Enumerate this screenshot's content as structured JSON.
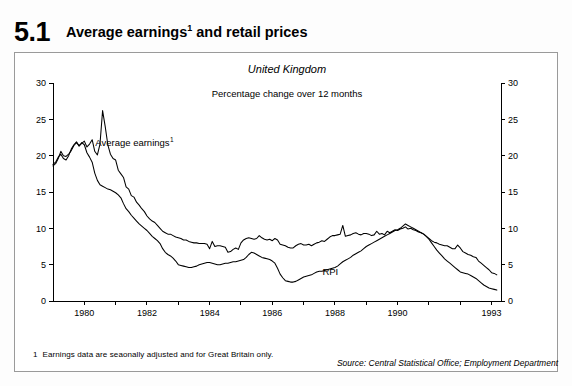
{
  "figure": {
    "number": "5.1",
    "title": "Average earnings",
    "title_sup": "1",
    "title_rest": " and retail prices"
  },
  "footnote": {
    "marker": "1",
    "text": "Earnings data are seaonally adjusted and for Great Britain only."
  },
  "source": {
    "text": "Source: Central Statistical Office; Employment Department"
  },
  "chart_data": {
    "type": "line",
    "title": "United Kingdom",
    "subtitle": "Percentage change over 12 months",
    "xlabel": "",
    "ylabel": "",
    "xlim": [
      1979.0,
      1993.3
    ],
    "ylim": [
      0,
      30
    ],
    "yticks": [
      0,
      5,
      10,
      15,
      20,
      25,
      30
    ],
    "ytick_labels": [
      "0",
      "5",
      "10",
      "15",
      "20",
      "25",
      "30"
    ],
    "xticks": [
      1980,
      1981,
      1982,
      1983,
      1984,
      1985,
      1986,
      1987,
      1988,
      1989,
      1990,
      1991,
      1992,
      1993
    ],
    "xtick_labels_shown": [
      "1980",
      "1982",
      "1984",
      "1986",
      "1988",
      "1990",
      "1993"
    ],
    "xtick_labels_values": [
      1980,
      1982,
      1984,
      1986,
      1988,
      1990,
      1993
    ],
    "grid": false,
    "legend_position": "inline-annotation",
    "annotations": [
      {
        "name": "average-earnings",
        "label": "Average earnings",
        "sup": "1",
        "x": 1980.35,
        "y": 21.3
      },
      {
        "name": "rpi",
        "label": "RPI",
        "x": 1987.6,
        "y": 3.6
      }
    ],
    "axes": {
      "left": true,
      "right": true,
      "bottom": true,
      "top": false
    },
    "series": [
      {
        "name": "Average earnings",
        "x": [
          1979.0,
          1979.083,
          1979.167,
          1979.25,
          1979.333,
          1979.417,
          1979.5,
          1979.583,
          1979.667,
          1979.75,
          1979.833,
          1979.917,
          1980.0,
          1980.083,
          1980.167,
          1980.25,
          1980.333,
          1980.417,
          1980.5,
          1980.583,
          1980.667,
          1980.75,
          1980.833,
          1980.917,
          1981.0,
          1981.083,
          1981.167,
          1981.25,
          1981.333,
          1981.417,
          1981.5,
          1981.583,
          1981.667,
          1981.75,
          1981.833,
          1981.917,
          1982.0,
          1982.083,
          1982.167,
          1982.25,
          1982.333,
          1982.417,
          1982.5,
          1982.583,
          1982.667,
          1982.75,
          1982.833,
          1982.917,
          1983.0,
          1983.083,
          1983.167,
          1983.25,
          1983.333,
          1983.417,
          1983.5,
          1983.583,
          1983.667,
          1983.75,
          1983.833,
          1983.917,
          1984.0,
          1984.083,
          1984.167,
          1984.25,
          1984.333,
          1984.417,
          1984.5,
          1984.583,
          1984.667,
          1984.75,
          1984.833,
          1984.917,
          1985.0,
          1985.083,
          1985.167,
          1985.25,
          1985.333,
          1985.417,
          1985.5,
          1985.583,
          1985.667,
          1985.75,
          1985.833,
          1985.917,
          1986.0,
          1986.083,
          1986.167,
          1986.25,
          1986.333,
          1986.417,
          1986.5,
          1986.583,
          1986.667,
          1986.75,
          1986.833,
          1986.917,
          1987.0,
          1987.083,
          1987.167,
          1987.25,
          1987.333,
          1987.417,
          1987.5,
          1987.583,
          1987.667,
          1987.75,
          1987.833,
          1987.917,
          1988.0,
          1988.083,
          1988.167,
          1988.25,
          1988.333,
          1988.417,
          1988.5,
          1988.583,
          1988.667,
          1988.75,
          1988.833,
          1988.917,
          1989.0,
          1989.083,
          1989.167,
          1989.25,
          1989.333,
          1989.417,
          1989.5,
          1989.583,
          1989.667,
          1989.75,
          1989.833,
          1989.917,
          1990.0,
          1990.083,
          1990.167,
          1990.25,
          1990.333,
          1990.417,
          1990.5,
          1990.583,
          1990.667,
          1990.75,
          1990.833,
          1990.917,
          1991.0,
          1991.083,
          1991.167,
          1991.25,
          1991.333,
          1991.417,
          1991.5,
          1991.583,
          1991.667,
          1991.75,
          1991.833,
          1991.917,
          1992.0,
          1992.083,
          1992.167,
          1992.25,
          1992.333,
          1992.417,
          1992.5,
          1992.583,
          1992.667,
          1992.75,
          1992.833,
          1992.917,
          1993.0,
          1993.083,
          1993.167
        ],
        "values": [
          18.6,
          18.9,
          19.6,
          20.6,
          20.0,
          19.9,
          20.2,
          20.7,
          21.4,
          21.8,
          21.4,
          21.7,
          22.0,
          21.2,
          21.6,
          22.2,
          20.6,
          20.1,
          21.6,
          26.2,
          24.0,
          21.5,
          20.2,
          19.6,
          19.4,
          18.0,
          17.5,
          17.0,
          15.7,
          15.4,
          14.5,
          14.3,
          13.6,
          13.2,
          12.7,
          12.3,
          11.7,
          11.3,
          11.0,
          10.8,
          10.4,
          10.0,
          9.6,
          9.4,
          9.2,
          9.2,
          9.0,
          8.8,
          8.7,
          8.6,
          8.4,
          8.4,
          8.2,
          8.1,
          8.0,
          8.0,
          7.9,
          7.9,
          7.9,
          7.8,
          7.2,
          8.2,
          7.5,
          7.6,
          7.6,
          7.5,
          7.4,
          6.7,
          6.8,
          7.1,
          7.3,
          7.1,
          8.0,
          8.4,
          8.6,
          8.7,
          8.6,
          8.5,
          8.6,
          9.0,
          8.7,
          8.5,
          8.4,
          8.5,
          8.3,
          8.6,
          8.4,
          7.8,
          7.7,
          7.6,
          7.4,
          7.3,
          7.3,
          7.6,
          7.8,
          7.9,
          7.7,
          7.7,
          7.8,
          7.6,
          7.8,
          8.0,
          8.1,
          8.3,
          8.2,
          8.5,
          8.8,
          9.0,
          9.0,
          9.1,
          9.2,
          10.4,
          8.9,
          9.0,
          9.1,
          9.3,
          9.4,
          9.2,
          9.1,
          9.3,
          9.3,
          9.2,
          9.0,
          9.1,
          9.6,
          9.2,
          9.3,
          9.1,
          9.6,
          9.4,
          9.6,
          9.8,
          9.7,
          9.9,
          10.0,
          10.2,
          9.9,
          10.0,
          9.8,
          9.7,
          9.5,
          9.4,
          9.2,
          8.9,
          8.6,
          8.3,
          8.1,
          8.0,
          7.8,
          7.7,
          7.6,
          7.6,
          7.4,
          7.2,
          7.2,
          7.7,
          7.3,
          6.8,
          6.6,
          6.4,
          6.3,
          6.1,
          6.0,
          5.5,
          5.2,
          4.9,
          4.6,
          4.3,
          3.9,
          3.8,
          3.6
        ]
      },
      {
        "name": "RPI",
        "x": [
          1979.0,
          1979.083,
          1979.167,
          1979.25,
          1979.333,
          1979.417,
          1979.5,
          1979.583,
          1979.667,
          1979.75,
          1979.833,
          1979.917,
          1980.0,
          1980.083,
          1980.167,
          1980.25,
          1980.333,
          1980.417,
          1980.5,
          1980.583,
          1980.667,
          1980.75,
          1980.833,
          1980.917,
          1981.0,
          1981.083,
          1981.167,
          1981.25,
          1981.333,
          1981.417,
          1981.5,
          1981.583,
          1981.667,
          1981.75,
          1981.833,
          1981.917,
          1982.0,
          1982.083,
          1982.167,
          1982.25,
          1982.333,
          1982.417,
          1982.5,
          1982.583,
          1982.667,
          1982.75,
          1982.833,
          1982.917,
          1983.0,
          1983.083,
          1983.167,
          1983.25,
          1983.333,
          1983.417,
          1983.5,
          1983.583,
          1983.667,
          1983.75,
          1983.833,
          1983.917,
          1984.0,
          1984.083,
          1984.167,
          1984.25,
          1984.333,
          1984.417,
          1984.5,
          1984.583,
          1984.667,
          1984.75,
          1984.833,
          1984.917,
          1985.0,
          1985.083,
          1985.167,
          1985.25,
          1985.333,
          1985.417,
          1985.5,
          1985.583,
          1985.667,
          1985.75,
          1985.833,
          1985.917,
          1986.0,
          1986.083,
          1986.167,
          1986.25,
          1986.333,
          1986.417,
          1986.5,
          1986.583,
          1986.667,
          1986.75,
          1986.833,
          1986.917,
          1987.0,
          1987.083,
          1987.167,
          1987.25,
          1987.333,
          1987.417,
          1987.5,
          1987.583,
          1987.667,
          1987.75,
          1987.833,
          1987.917,
          1988.0,
          1988.083,
          1988.167,
          1988.25,
          1988.333,
          1988.417,
          1988.5,
          1988.583,
          1988.667,
          1988.75,
          1988.833,
          1988.917,
          1989.0,
          1989.083,
          1989.167,
          1989.25,
          1989.333,
          1989.417,
          1989.5,
          1989.583,
          1989.667,
          1989.75,
          1989.833,
          1989.917,
          1990.0,
          1990.083,
          1990.167,
          1990.25,
          1990.333,
          1990.417,
          1990.5,
          1990.583,
          1990.667,
          1990.75,
          1990.833,
          1990.917,
          1991.0,
          1991.083,
          1991.167,
          1991.25,
          1991.333,
          1991.417,
          1991.5,
          1991.583,
          1991.667,
          1991.75,
          1991.833,
          1991.917,
          1992.0,
          1992.083,
          1992.167,
          1992.25,
          1992.333,
          1992.417,
          1992.5,
          1992.583,
          1992.667,
          1992.75,
          1992.833,
          1992.917,
          1993.0,
          1993.083,
          1993.167
        ],
        "values": [
          18.8,
          19.1,
          19.8,
          20.2,
          19.6,
          19.4,
          20.0,
          20.9,
          21.5,
          21.9,
          21.3,
          21.8,
          21.5,
          20.4,
          19.8,
          19.1,
          17.6,
          16.6,
          16.0,
          15.8,
          15.6,
          15.4,
          15.3,
          15.1,
          14.9,
          14.6,
          14.2,
          13.4,
          12.7,
          12.3,
          11.8,
          11.4,
          11.0,
          10.6,
          10.3,
          10.0,
          9.7,
          9.3,
          8.9,
          8.6,
          8.3,
          7.9,
          7.2,
          6.7,
          6.4,
          6.2,
          5.9,
          5.5,
          5.0,
          4.9,
          4.8,
          4.7,
          4.6,
          4.6,
          4.7,
          4.8,
          5.0,
          5.1,
          5.2,
          5.3,
          5.3,
          5.2,
          5.1,
          5.0,
          5.0,
          5.1,
          5.2,
          5.2,
          5.3,
          5.4,
          5.4,
          5.5,
          5.6,
          5.7,
          6.0,
          6.4,
          6.7,
          6.6,
          6.4,
          6.2,
          6.0,
          5.9,
          5.8,
          5.7,
          5.5,
          5.2,
          4.5,
          3.7,
          3.2,
          2.8,
          2.7,
          2.6,
          2.6,
          2.7,
          2.9,
          3.1,
          3.3,
          3.4,
          3.5,
          3.6,
          3.8,
          4.0,
          4.1,
          4.1,
          4.2,
          4.3,
          4.4,
          4.5,
          4.6,
          4.8,
          5.1,
          5.4,
          5.6,
          5.8,
          6.0,
          6.3,
          6.5,
          6.7,
          6.9,
          7.2,
          7.5,
          7.7,
          7.9,
          8.1,
          8.3,
          8.5,
          8.7,
          8.9,
          9.1,
          9.3,
          9.5,
          9.7,
          9.8,
          10.0,
          10.3,
          10.6,
          10.4,
          10.2,
          10.0,
          9.8,
          9.6,
          9.4,
          9.2,
          8.9,
          8.5,
          8.0,
          7.5,
          7.0,
          6.6,
          6.2,
          5.8,
          5.5,
          5.2,
          4.9,
          4.6,
          4.3,
          4.0,
          3.9,
          3.8,
          3.7,
          3.5,
          3.3,
          3.1,
          2.8,
          2.5,
          2.2,
          2.0,
          1.8,
          1.7,
          1.6,
          1.5
        ]
      }
    ]
  }
}
